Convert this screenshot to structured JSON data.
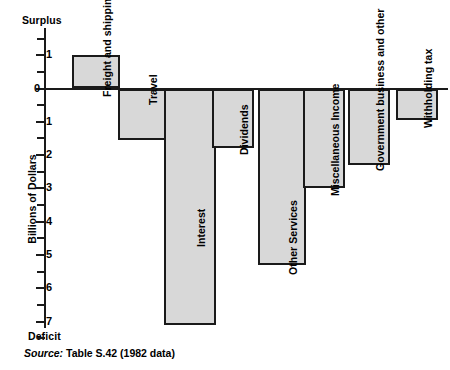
{
  "chart_data": {
    "type": "bar",
    "title": "",
    "subtitle": "",
    "xlabel": "",
    "ylabel": "Billions of Dollars",
    "ylim": [
      -7.5,
      1.5
    ],
    "y_axis_top_label": "Surplus",
    "y_axis_bottom_label": "Deficit",
    "y_tick_labels": [
      "1",
      "0",
      "1",
      "2",
      "3",
      "4",
      "5",
      "6",
      "7"
    ],
    "y_tick_values": [
      1,
      0,
      -1,
      -2,
      -3,
      -4,
      -5,
      -6,
      -7
    ],
    "y_minor_ticks": [
      1.5,
      0.5,
      -0.5,
      -1.5,
      -2.5,
      -3.5,
      -4.5,
      -5.5,
      -6.5,
      -7.5
    ],
    "grid": false,
    "legend": "none",
    "note": "Values are in billions of dollars; positive = surplus, negative = deficit",
    "categories": [
      "Freight and shipping",
      "Travel",
      "Interest",
      "Dividends",
      "Other Services",
      "Miscellaneous Income",
      "Government business and other",
      "Withholding tax"
    ],
    "values": [
      1.0,
      -1.55,
      -7.1,
      -1.8,
      -5.3,
      -3.0,
      -2.3,
      -0.95
    ]
  },
  "source": {
    "prefix": "Source:",
    "text": "Table S.42 (1982 data)"
  },
  "colors": {
    "bar_fill": "#d8d8d8",
    "bar_stroke": "#1a1a1a",
    "axis": "#1a1a1a",
    "background": "#ffffff"
  }
}
